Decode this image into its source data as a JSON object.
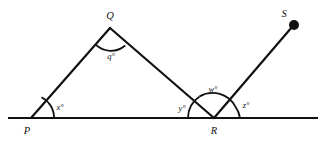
{
  "figure": {
    "type": "geometry-diagram",
    "background_color": "#ffffff",
    "stroke_color": "#111111",
    "points": {
      "P": {
        "label": "P",
        "x": 31,
        "y": 118
      },
      "Q": {
        "label": "Q",
        "x": 110,
        "y": 28
      },
      "R": {
        "label": "R",
        "x": 214,
        "y": 118
      },
      "S": {
        "label": "S",
        "x": 294,
        "y": 25
      }
    },
    "angles": {
      "x": {
        "label": "x°",
        "vertex": "P"
      },
      "q": {
        "label": "q°",
        "vertex": "Q"
      },
      "y": {
        "label": "y°",
        "vertex": "R"
      },
      "w": {
        "label": "w°",
        "vertex": "R"
      },
      "z": {
        "label": "z°",
        "vertex": "R"
      }
    },
    "baseline": {
      "x1": 8,
      "x2": 318,
      "y": 118
    },
    "segments": [
      {
        "from": "P",
        "to": "Q"
      },
      {
        "from": "Q",
        "to": "R"
      },
      {
        "from": "R",
        "to": "S"
      }
    ],
    "markers": [
      {
        "at": "S",
        "shape": "filled-dot"
      }
    ]
  }
}
